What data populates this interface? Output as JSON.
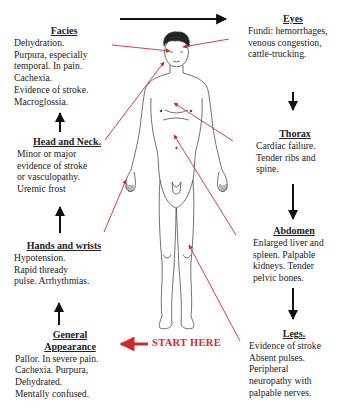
{
  "colors": {
    "text": "#222222",
    "arrow_black": "#111111",
    "arrow_red": "#cc2a2a"
  },
  "sequence": {
    "start_label": "START HERE",
    "steps": [
      {
        "id": "general",
        "title": "General Appearance",
        "title_lines": [
          "General",
          "Appearance"
        ],
        "lines": [
          "Pallor. In severe pain.",
          "Cachexia. Purpura,",
          "Dehydrated.",
          "Mentally confused."
        ]
      },
      {
        "id": "hands",
        "title": "Hands and wrists",
        "lines": [
          "Hypotension.",
          "Rapid thready",
          "pulse. Arrhythmias."
        ]
      },
      {
        "id": "head-neck",
        "title": "Head and Neck.",
        "lines": [
          "Minor or major",
          "evidence of stroke",
          "or vasculopathy.",
          "Uremic frost"
        ]
      },
      {
        "id": "facies",
        "title": "Facies",
        "lines": [
          "Dehydration.",
          "Purpura, especially",
          "temporal. In pain.",
          "Cachexia.",
          "Evidence of stroke.",
          "Macroglossia."
        ]
      },
      {
        "id": "eyes",
        "title": "Eyes",
        "lines": [
          "Fundi: hemorrhages,",
          "venous congestion,",
          "cattle-trucking."
        ]
      },
      {
        "id": "thorax",
        "title": "Thorax",
        "lines": [
          "Cardiac failure.",
          "Tender ribs and",
          "spine."
        ]
      },
      {
        "id": "abdomen",
        "title": "Abdomen",
        "lines": [
          "Enlarged  liver and",
          "spleen. Palpable",
          "kidneys. Tender",
          "pelvic bones."
        ]
      },
      {
        "id": "legs",
        "title": "Legs.",
        "lines": [
          "Evidence of stroke",
          "Absent pulses.",
          "Peripheral",
          "neuropathy with",
          "palpable nerves."
        ]
      }
    ]
  },
  "figure": {
    "icon": "human-body-outline-icon"
  }
}
